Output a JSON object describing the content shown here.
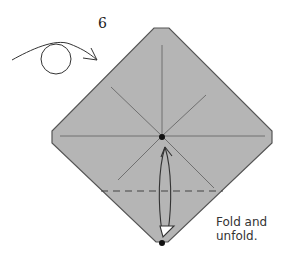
{
  "diagram": {
    "step_number": "6",
    "caption_line1": "Fold and",
    "caption_line2": "unfold.",
    "colors": {
      "paper_fill": "#b5b5b5",
      "edge": "#555555",
      "crease": "#707070",
      "dashed": "#444444",
      "arrow": "#333333",
      "dot": "#111111"
    },
    "icons": {
      "turn_over": "turn-over-arrow-icon",
      "fold_unfold": "fold-unfold-arrow-icon"
    }
  }
}
